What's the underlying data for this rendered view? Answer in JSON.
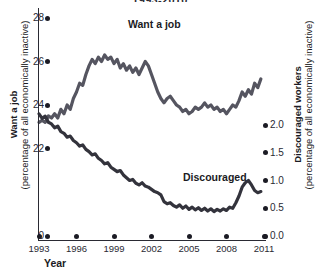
{
  "chart_data": {
    "type": "line",
    "title": "1993-2010",
    "xlabel": "Year",
    "grid": false,
    "legend_position": "inline-annotations",
    "x_axis": {
      "label": "Year",
      "ticks": [
        "1993",
        "1996",
        "1999",
        "2002",
        "2005",
        "2008",
        "2011"
      ],
      "tick_values": [
        1993,
        1996,
        1999,
        2002,
        2005,
        2008,
        2011
      ],
      "xlim": [
        1993,
        2011
      ]
    },
    "y_axis_left": {
      "title_bold": "Want a job",
      "title_sub": "(percentage of all economically inactive)",
      "ticks": [
        "0",
        "22",
        "24",
        "26",
        "28"
      ],
      "tick_values": [
        0,
        22,
        24,
        26,
        28
      ],
      "ylim": [
        21.0,
        28.0
      ],
      "broken_axis": true,
      "color": "#555560"
    },
    "y_axis_right": {
      "title_bold": "Discouraged workers",
      "title_sub": "(percentage of all economically inactive)",
      "ticks": [
        "0.0",
        "0.5",
        "1.0",
        "1.5",
        "2.0"
      ],
      "tick_values": [
        0.0,
        0.5,
        1.0,
        1.5,
        2.0
      ],
      "ylim": [
        0.0,
        2.3
      ],
      "color": "#33333c"
    },
    "series": [
      {
        "name": "Want a job",
        "axis": "left",
        "color": "#555560",
        "annotation": "Want a job",
        "x": [
          1993.0,
          1993.25,
          1993.5,
          1993.75,
          1994.0,
          1994.25,
          1994.5,
          1994.75,
          1995.0,
          1995.25,
          1995.5,
          1995.75,
          1996.0,
          1996.25,
          1996.5,
          1996.75,
          1997.0,
          1997.25,
          1997.5,
          1997.75,
          1998.0,
          1998.25,
          1998.5,
          1998.75,
          1999.0,
          1999.25,
          1999.5,
          1999.75,
          2000.0,
          2000.25,
          2000.5,
          2000.75,
          2001.0,
          2001.25,
          2001.5,
          2001.75,
          2002.0,
          2002.25,
          2002.5,
          2002.75,
          2003.0,
          2003.25,
          2003.5,
          2003.75,
          2004.0,
          2004.25,
          2004.5,
          2004.75,
          2005.0,
          2005.25,
          2005.5,
          2005.75,
          2006.0,
          2006.25,
          2006.5,
          2006.75,
          2007.0,
          2007.25,
          2007.5,
          2007.75,
          2008.0,
          2008.25,
          2008.5,
          2008.75,
          2009.0,
          2009.25,
          2009.5,
          2009.75,
          2010.0,
          2010.25,
          2010.5,
          2010.75
        ],
        "values": [
          23.2,
          23.3,
          23.2,
          23.5,
          23.4,
          23.6,
          23.4,
          23.8,
          23.6,
          24.0,
          23.8,
          24.3,
          24.6,
          25.0,
          24.9,
          25.4,
          25.8,
          26.1,
          25.9,
          26.2,
          26.0,
          26.3,
          26.1,
          26.2,
          25.9,
          26.1,
          25.7,
          25.9,
          25.6,
          25.8,
          25.5,
          25.7,
          25.4,
          25.7,
          26.0,
          25.8,
          25.4,
          25.0,
          24.6,
          24.3,
          24.1,
          24.3,
          24.4,
          24.2,
          24.0,
          23.9,
          23.7,
          23.8,
          23.6,
          23.7,
          23.9,
          23.8,
          23.9,
          24.1,
          23.9,
          24.0,
          23.8,
          23.9,
          23.7,
          23.8,
          23.6,
          23.8,
          24.0,
          23.9,
          24.2,
          24.6,
          24.4,
          24.7,
          24.5,
          25.0,
          24.8,
          25.2
        ]
      },
      {
        "name": "Discouraged",
        "axis": "right",
        "color": "#33333c",
        "annotation": "Discouraged",
        "x": [
          1993.0,
          1993.25,
          1993.5,
          1993.75,
          1994.0,
          1994.25,
          1994.5,
          1994.75,
          1995.0,
          1995.25,
          1995.5,
          1995.75,
          1996.0,
          1996.25,
          1996.5,
          1996.75,
          1997.0,
          1997.25,
          1997.5,
          1997.75,
          1998.0,
          1998.25,
          1998.5,
          1998.75,
          1999.0,
          1999.25,
          1999.5,
          1999.75,
          2000.0,
          2000.25,
          2000.5,
          2000.75,
          2001.0,
          2001.25,
          2001.5,
          2001.75,
          2002.0,
          2002.25,
          2002.5,
          2002.75,
          2003.0,
          2003.25,
          2003.5,
          2003.75,
          2004.0,
          2004.25,
          2004.5,
          2004.75,
          2005.0,
          2005.25,
          2005.5,
          2005.75,
          2006.0,
          2006.25,
          2006.5,
          2006.75,
          2007.0,
          2007.25,
          2007.5,
          2007.75,
          2008.0,
          2008.25,
          2008.5,
          2008.75,
          2009.0,
          2009.25,
          2009.5,
          2009.75,
          2010.0,
          2010.25,
          2010.5,
          2010.75
        ],
        "values": [
          2.2,
          2.12,
          2.16,
          2.05,
          2.02,
          1.95,
          1.98,
          1.88,
          1.85,
          1.78,
          1.8,
          1.72,
          1.68,
          1.62,
          1.64,
          1.56,
          1.52,
          1.46,
          1.48,
          1.4,
          1.36,
          1.3,
          1.32,
          1.24,
          1.2,
          1.16,
          1.18,
          1.1,
          1.05,
          1.0,
          1.02,
          0.95,
          0.92,
          0.96,
          0.9,
          0.88,
          0.84,
          0.8,
          0.78,
          0.74,
          0.62,
          0.58,
          0.6,
          0.55,
          0.52,
          0.56,
          0.5,
          0.54,
          0.48,
          0.52,
          0.47,
          0.51,
          0.46,
          0.5,
          0.45,
          0.49,
          0.44,
          0.48,
          0.45,
          0.49,
          0.46,
          0.52,
          0.5,
          0.6,
          0.72,
          0.88,
          0.96,
          1.0,
          0.92,
          0.82,
          0.78,
          0.8
        ]
      }
    ]
  },
  "axes": {
    "left_title_bold": "Want a job",
    "left_title_sub": "(percentage of all economically inactive)",
    "right_title_bold": "Discouraged workers",
    "right_title_sub": "(percentage of all economically inactive)",
    "x_title": "Year"
  },
  "labels": {
    "want_a_job": "Want a job",
    "discouraged": "Discouraged"
  },
  "title": "1993-2010"
}
